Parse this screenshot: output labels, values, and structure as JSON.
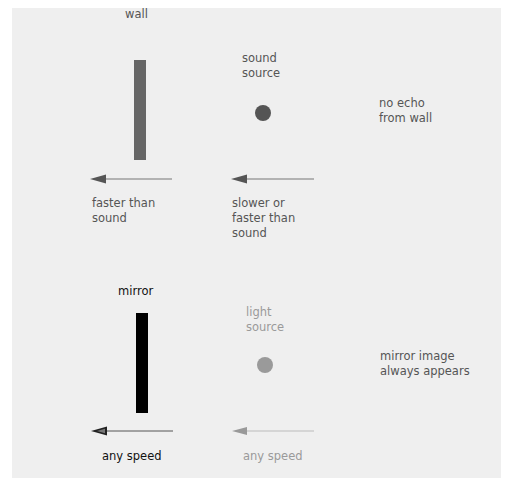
{
  "diagram": {
    "top_row": {
      "object_label": "wall",
      "source_label": "sound\nsource",
      "result_label": "no echo\nfrom wall",
      "object_speed_label": "faster than\nsound",
      "source_speed_label": "slower or\nfaster than\nsound",
      "object_color": "#666666",
      "source_color": "#555555",
      "arrow_color": "#666666"
    },
    "bottom_row": {
      "object_label": "mirror",
      "source_label": "light\nsource",
      "result_label": "mirror image\nalways appears",
      "object_speed_label": "any speed",
      "source_speed_label": "any speed",
      "object_color": "#000000",
      "source_color": "#9a9a9a",
      "arrow_color_object": "#333333",
      "arrow_color_source": "#aaaaaa"
    },
    "panel_color": "#efefef"
  }
}
